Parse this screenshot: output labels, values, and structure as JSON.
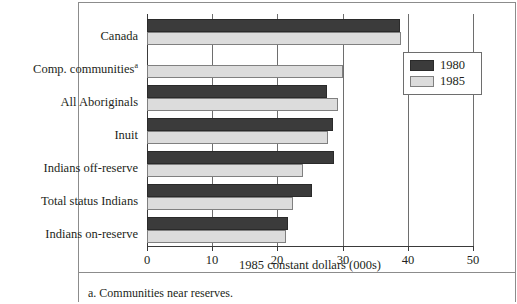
{
  "chart_data": {
    "type": "bar",
    "orientation": "horizontal",
    "title": "",
    "xlabel": "1985 constant dollars (000s)",
    "ylabel": "",
    "xlim": [
      0,
      50
    ],
    "xticks": [
      0,
      10,
      20,
      30,
      40,
      50
    ],
    "xtick_labels": [
      "0",
      "10",
      "20",
      "30",
      "40",
      "50"
    ],
    "grid": true,
    "grid_axis": "x",
    "legend_position": "right-top",
    "categories": [
      "Canada",
      "Comp. communities",
      "All Aboriginals",
      "Inuit",
      "Indians off-reserve",
      "Total status Indians",
      "Indians on-reserve"
    ],
    "category_footnote_marker": "a",
    "category_with_footnote": "Comp. communities",
    "series": [
      {
        "name": "1980",
        "color": "#3b3b3b",
        "values": [
          38.8,
          null,
          27.6,
          28.5,
          28.7,
          25.3,
          21.6
        ]
      },
      {
        "name": "1985",
        "color": "#dcdcdc",
        "values": [
          39.0,
          30.0,
          29.3,
          27.7,
          23.9,
          22.4,
          21.3
        ]
      }
    ],
    "annotations": [
      "a. Communities near reserves."
    ]
  },
  "axis": {
    "title": "1985 constant dollars (000s)",
    "ticks": [
      "0",
      "10",
      "20",
      "30",
      "40",
      "50"
    ]
  },
  "categories": {
    "canada": "Canada",
    "comp_communities": "Comp. communities",
    "comp_communities_marker": "a",
    "all_aboriginals": "All Aboriginals",
    "inuit": "Inuit",
    "indians_off_reserve": "Indians off-reserve",
    "total_status_indians": "Total status Indians",
    "indians_on_reserve": "Indians on-reserve"
  },
  "legend": {
    "items": [
      {
        "label": "1980",
        "color": "#3b3b3b"
      },
      {
        "label": "1985",
        "color": "#dcdcdc"
      }
    ]
  },
  "footnote": {
    "text": "a. Communities near reserves."
  }
}
